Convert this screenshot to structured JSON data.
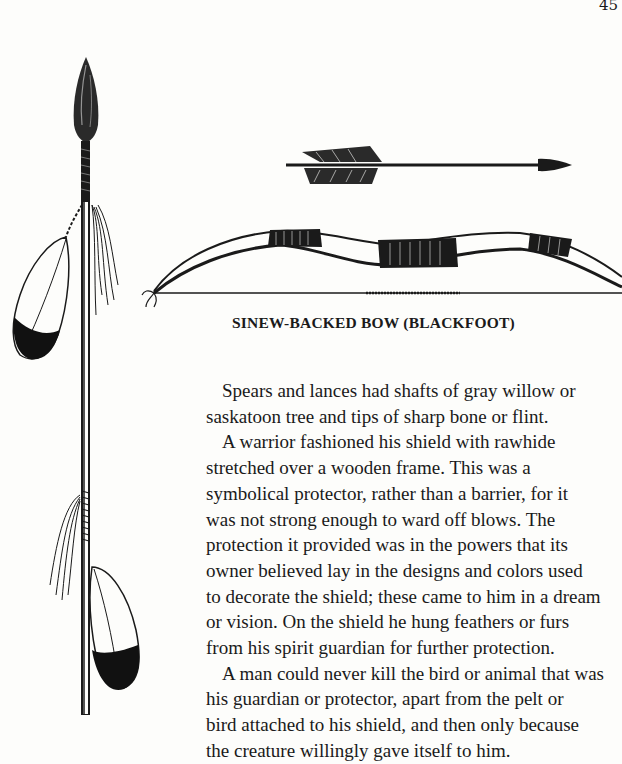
{
  "page": {
    "number": "45"
  },
  "illustrations": {
    "spear": {
      "icon": "feathered-lance-icon"
    },
    "arrow": {
      "icon": "arrow-icon"
    },
    "bow": {
      "icon": "sinew-backed-bow-icon"
    }
  },
  "caption": "SINEW-BACKED BOW (BLACKFOOT)",
  "paragraphs": [
    {
      "lines": "Spears and lances had shafts of gray willow or\nsaskatoon tree and tips of sharp bone or flint."
    },
    {
      "lines": "A warrior fashioned his shield with rawhide\nstretched over a wooden frame. This was a\nsymbolical protector, rather than a barrier, for it\nwas not strong enough to ward off blows. The\nprotection it provided was in the powers that its\nowner believed lay in the designs and colors used\nto decorate the shield; these came to him in a dream\nor vision. On the shield he hung feathers or furs\nfrom his spirit guardian for further protection."
    },
    {
      "lines": "A man could never kill the bird or animal that was\nhis guardian or protector, apart from the pelt or\nbird attached to his shield, and then only because\nthe creature willingly gave itself to him."
    }
  ]
}
